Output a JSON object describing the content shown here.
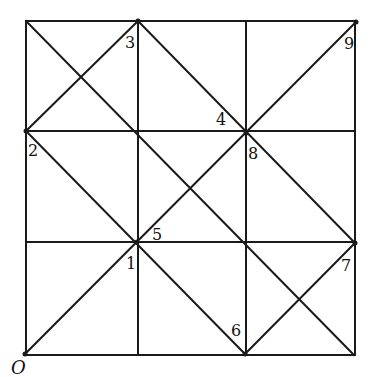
{
  "diagram": {
    "type": "grid-with-diagonals",
    "stroke_color": "#1a1a1a",
    "background": "#ffffff",
    "grid": {
      "rows": 3,
      "cols": 3,
      "x_lines": [
        26,
        138,
        246,
        355
      ],
      "y_lines": [
        21,
        131,
        242,
        355
      ]
    },
    "segments": [
      {
        "name": "main-diagonal-o-to-9",
        "x1": 25,
        "y1": 354,
        "x2": 356,
        "y2": 22
      },
      {
        "name": "anti-diagonal-topleft-to-bottomright",
        "x1": 26,
        "y1": 21,
        "x2": 354,
        "y2": 355
      },
      {
        "name": "diagonal-2-to-3",
        "x1": 26,
        "y1": 131,
        "x2": 138,
        "y2": 21
      },
      {
        "name": "diagonal-2-to-6",
        "x1": 26,
        "y1": 131,
        "x2": 245,
        "y2": 354
      },
      {
        "name": "diagonal-3-to-7",
        "x1": 138,
        "y1": 21,
        "x2": 355,
        "y2": 243
      },
      {
        "name": "diagonal-6-to-7",
        "x1": 245,
        "y1": 354,
        "x2": 355,
        "y2": 243
      }
    ],
    "points": [
      {
        "id": "O",
        "x": 25,
        "y": 354
      },
      {
        "id": "1",
        "x": 137,
        "y": 242
      },
      {
        "id": "2",
        "x": 26,
        "y": 131
      },
      {
        "id": "3",
        "x": 138,
        "y": 21
      },
      {
        "id": "4",
        "x": 246,
        "y": 133
      },
      {
        "id": "5",
        "x": 137,
        "y": 242
      },
      {
        "id": "6",
        "x": 245,
        "y": 354
      },
      {
        "id": "7",
        "x": 355,
        "y": 243
      },
      {
        "id": "8",
        "x": 246,
        "y": 133
      },
      {
        "id": "9",
        "x": 356,
        "y": 22
      }
    ],
    "labels": [
      {
        "text": "O",
        "x": 11,
        "y": 359,
        "italic": true
      },
      {
        "text": "1",
        "x": 126,
        "y": 256
      },
      {
        "text": "2",
        "x": 28,
        "y": 143
      },
      {
        "text": "3",
        "x": 125,
        "y": 35
      },
      {
        "text": "4",
        "x": 216,
        "y": 112
      },
      {
        "text": "5",
        "x": 152,
        "y": 227
      },
      {
        "text": "6",
        "x": 231,
        "y": 323
      },
      {
        "text": "7",
        "x": 341,
        "y": 258
      },
      {
        "text": "8",
        "x": 248,
        "y": 146
      },
      {
        "text": "9",
        "x": 344,
        "y": 36
      }
    ]
  }
}
